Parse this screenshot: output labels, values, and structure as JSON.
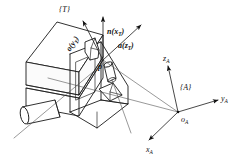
{
  "figure": {
    "kind": "engineering-line-drawing",
    "background_color": "#ffffff",
    "line_color": "#1a1a1a"
  },
  "tool_frame": {
    "frame_label": "{T}",
    "axes": [
      {
        "id": "n",
        "label_vector": "n",
        "label_paren_open": "(",
        "label_axis": "x",
        "label_sub": "T",
        "label_paren_close": ")",
        "full": "n(xT)",
        "direction": "up"
      },
      {
        "id": "o",
        "label_vector": "o",
        "label_paren_open": "(",
        "label_axis": "y",
        "label_sub": "T",
        "label_paren_close": ")",
        "full": "o(yT)",
        "direction": "upper-left"
      },
      {
        "id": "a",
        "label_vector": "a",
        "label_paren_open": "(",
        "label_axis": "z",
        "label_sub": "T",
        "label_paren_close": ")",
        "full": "a(zT)",
        "direction": "upper-right"
      }
    ],
    "origin_marker": "p"
  },
  "base_frame": {
    "frame_label": "{A}",
    "origin_label": "o",
    "origin_sub": "A",
    "axes": [
      {
        "id": "z",
        "label": "z",
        "sub": "A",
        "direction": "up-left-tilt"
      },
      {
        "id": "y",
        "label": "y",
        "sub": "A",
        "direction": "right"
      },
      {
        "id": "x",
        "label": "x",
        "sub": "A",
        "direction": "lower-left"
      }
    ]
  },
  "objects": [
    {
      "name": "gripper-body",
      "description": "rectangular block body of end effector"
    },
    {
      "name": "gripper-finger-upper",
      "description": "upper jaw of two-finger gripper"
    },
    {
      "name": "gripper-finger-lower",
      "description": "lower jaw of two-finger gripper"
    },
    {
      "name": "grasped-peg",
      "description": "small cylindrical peg held between fingers"
    },
    {
      "name": "mounting-shaft",
      "description": "cylindrical shaft extending to lower left"
    }
  ]
}
